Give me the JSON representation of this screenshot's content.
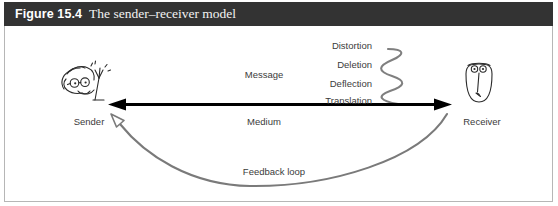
{
  "figure": {
    "number": "Figure 15.4",
    "title": "The sender–receiver model",
    "title_bar_color": "#333333",
    "title_text_color": "#ffffff",
    "panel_background": "#ffffff",
    "panel_border_color": "#b6b6b6"
  },
  "diagram": {
    "type": "communication-model",
    "actors": [
      {
        "id": "sender",
        "label": "Sender",
        "icon": "cartoon-face-waving-icon"
      },
      {
        "id": "receiver",
        "label": "Receiver",
        "icon": "cartoon-head-oval-icon"
      }
    ],
    "channel": {
      "above_label": "Message",
      "below_label": "Medium",
      "arrow": "double-headed-horizontal-arrow",
      "arrow_color": "#000000"
    },
    "noise_labels": [
      "Distortion",
      "Deletion",
      "Deflection",
      "Translation"
    ],
    "noise_squiggle": {
      "shape": "vertical-zigzag-wave",
      "color": "#7f7f7f"
    },
    "feedback": {
      "label": "Feedback loop",
      "arrow": "curved-arrow-receiver-to-sender",
      "arrowhead": "hollow-triangle",
      "color": "#7a7a7a"
    }
  }
}
